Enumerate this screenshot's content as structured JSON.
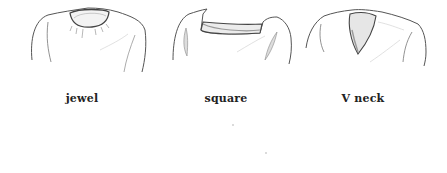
{
  "figures": [
    {
      "id": "jewel",
      "label": "jewel"
    },
    {
      "id": "square",
      "label": "square"
    },
    {
      "id": "vneck",
      "label": "V neck"
    }
  ],
  "colors": {
    "background": "#ffffff",
    "line": "#555555",
    "shading": "#9a9a9a",
    "label": "#222222"
  }
}
